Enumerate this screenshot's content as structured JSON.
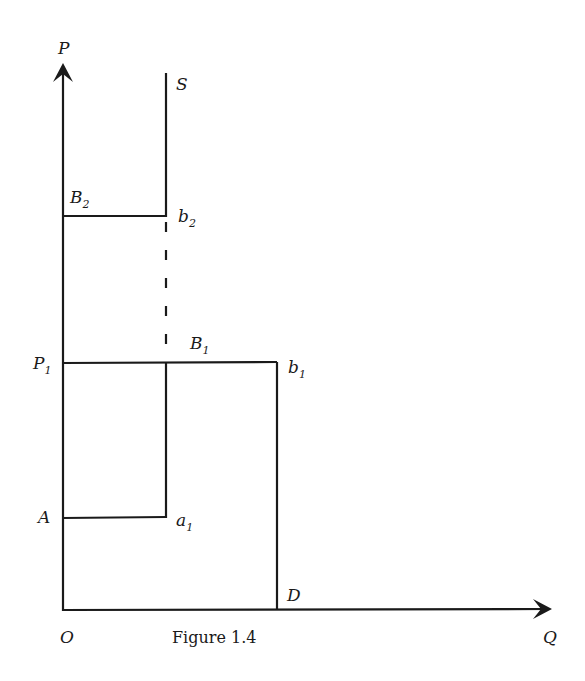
{
  "figure": {
    "caption": "Figure 1.4",
    "axes": {
      "y_label": "P",
      "x_label": "Q",
      "origin_label": "O"
    },
    "curves": {
      "supply_label": "S",
      "demand_label": "D"
    },
    "points": {
      "B2": {
        "main": "B",
        "sub": "2"
      },
      "b2": {
        "main": "b",
        "sub": "2"
      },
      "P1": {
        "main": "P",
        "sub": "1"
      },
      "B1": {
        "main": "B",
        "sub": "1"
      },
      "b1": {
        "main": "b",
        "sub": "1"
      },
      "A": {
        "main": "A"
      },
      "a1": {
        "main": "a",
        "sub": "1"
      }
    },
    "colors": {
      "ink": "#1a1a1a",
      "background": "#ffffff"
    }
  }
}
